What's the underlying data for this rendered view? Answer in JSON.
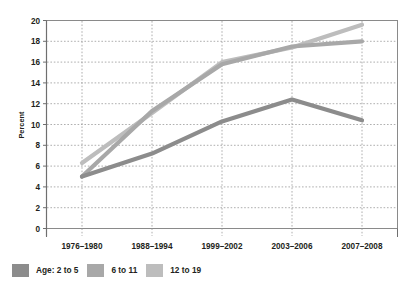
{
  "chart_data": {
    "type": "line",
    "title": "",
    "subtitle": "",
    "xlabel": "",
    "ylabel": "Percent",
    "ylim": [
      0,
      20
    ],
    "yticks": [
      0,
      2,
      4,
      6,
      8,
      10,
      12,
      14,
      16,
      18,
      20
    ],
    "ytick_labels": [
      "0",
      "2",
      "4",
      "6",
      "8",
      "10",
      "12",
      "14",
      "16",
      "18",
      "20"
    ],
    "categories": [
      "1976–1980",
      "1988–1994",
      "1999–2002",
      "2003–2006",
      "2007–2008"
    ],
    "grid": true,
    "grid_style": "dotted",
    "legend_position": "bottom-left",
    "legend_prefix": "Age:",
    "series": [
      {
        "name": "2 to 5",
        "legend_label": "Age: 2 to 5",
        "color": "#8c8c8c",
        "values": [
          5.0,
          7.2,
          10.3,
          12.4,
          10.4
        ]
      },
      {
        "name": "6 to 11",
        "legend_label": "6 to 11",
        "color": "#a8a8a8",
        "values": [
          5.0,
          11.3,
          15.8,
          17.5,
          18.0
        ]
      },
      {
        "name": "12 to 19",
        "legend_label": "12 to 19",
        "color": "#bdbdbd",
        "values": [
          6.3,
          11.1,
          16.0,
          17.4,
          19.6
        ]
      }
    ]
  },
  "axes": {
    "ylabel": "Percent",
    "ytick_labels": [
      "20",
      "18",
      "16",
      "14",
      "12",
      "10",
      "8",
      "6",
      "4",
      "2",
      "0"
    ],
    "xtick_labels": [
      "1976–1980",
      "1988–1994",
      "1999–2002",
      "2003–2006",
      "2007–2008"
    ]
  },
  "legend": {
    "items": [
      {
        "label": "Age: 2 to 5",
        "color": "#8c8c8c"
      },
      {
        "label": "6 to 11",
        "color": "#a8a8a8"
      },
      {
        "label": "12 to 19",
        "color": "#bdbdbd"
      }
    ]
  },
  "colors": {
    "axis": "#8a8a8a",
    "grid": "#a0a0a0",
    "text": "#231f20",
    "background": "#ffffff"
  }
}
